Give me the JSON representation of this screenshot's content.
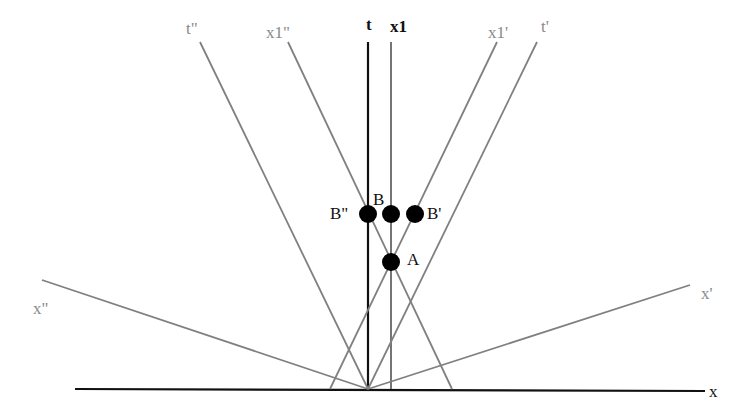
{
  "diagram": {
    "colors": {
      "primary_axes": "#111111",
      "rotated_axes": "#808080",
      "points": "#000000",
      "background": "#ffffff"
    },
    "origin": {
      "x": 368,
      "y": 389
    },
    "axes": [
      {
        "id": "x",
        "label": "x",
        "x1": 75,
        "y1": 389,
        "x2": 705,
        "y2": 391,
        "color": "#111111",
        "width": 2.2
      },
      {
        "id": "t",
        "label": "t",
        "x1": 368,
        "y1": 42,
        "x2": 368,
        "y2": 389,
        "color": "#111111",
        "width": 2.2
      },
      {
        "id": "x1",
        "label": "x1",
        "x1": 391,
        "y1": 42,
        "x2": 391,
        "y2": 389,
        "color": "#666666",
        "width": 1.8
      },
      {
        "id": "t_pp",
        "label": "t\"",
        "x1": 200,
        "y1": 42,
        "x2": 368,
        "y2": 389,
        "color": "#808080",
        "width": 1.8
      },
      {
        "id": "t_p",
        "label": "t'",
        "x1": 537,
        "y1": 42,
        "x2": 368,
        "y2": 389,
        "color": "#808080",
        "width": 1.8
      },
      {
        "id": "x1_pp",
        "label": "x1\"",
        "x1": 288,
        "y1": 42,
        "x2": 452,
        "y2": 389,
        "color": "#808080",
        "width": 1.8
      },
      {
        "id": "x1_p",
        "label": "x1'",
        "x1": 497,
        "y1": 42,
        "x2": 330,
        "y2": 389,
        "color": "#808080",
        "width": 1.8
      },
      {
        "id": "x_pp",
        "label": "x\"",
        "x1": 42,
        "y1": 280,
        "x2": 368,
        "y2": 389,
        "color": "#808080",
        "width": 1.8
      },
      {
        "id": "x_p",
        "label": "x'",
        "x1": 690,
        "y1": 285,
        "x2": 368,
        "y2": 389,
        "color": "#808080",
        "width": 1.8
      }
    ],
    "axis_labels": [
      {
        "id": "t",
        "text": "t",
        "x": 366,
        "y": 16,
        "style": "dark bold"
      },
      {
        "id": "x1",
        "text": "x1",
        "x": 390,
        "y": 18,
        "style": "dark bold"
      },
      {
        "id": "t_pp",
        "text": "t\"",
        "x": 186,
        "y": 20,
        "style": "gray"
      },
      {
        "id": "x1_pp",
        "text": "x1\"",
        "x": 266,
        "y": 24,
        "style": "gray"
      },
      {
        "id": "x1_p",
        "text": "x1'",
        "x": 488,
        "y": 24,
        "style": "gray"
      },
      {
        "id": "t_p",
        "text": "t'",
        "x": 541,
        "y": 18,
        "style": "gray"
      },
      {
        "id": "x_pp",
        "text": "x\"",
        "x": 33,
        "y": 300,
        "style": "gray"
      },
      {
        "id": "x_p",
        "text": "x'",
        "x": 701,
        "y": 285,
        "style": "gray"
      },
      {
        "id": "x",
        "text": "x",
        "x": 709,
        "y": 383,
        "style": "dark"
      }
    ],
    "points": [
      {
        "id": "B_pp",
        "label": "B\"",
        "cx": 368,
        "cy": 214,
        "r": 9,
        "label_x": 330,
        "label_y": 205
      },
      {
        "id": "B",
        "label": "B",
        "cx": 391,
        "cy": 214,
        "r": 9,
        "label_x": 373,
        "label_y": 191
      },
      {
        "id": "B_p",
        "label": "B'",
        "cx": 415,
        "cy": 214,
        "r": 9,
        "label_x": 427,
        "label_y": 205
      },
      {
        "id": "A",
        "label": "A",
        "cx": 391,
        "cy": 262,
        "r": 9,
        "label_x": 407,
        "label_y": 251
      }
    ]
  }
}
